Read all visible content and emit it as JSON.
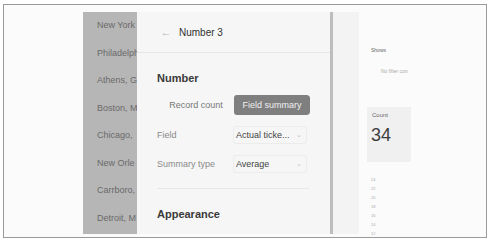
{
  "city_list": {
    "items": [
      "New York",
      "Philadelphia",
      "Athens, G",
      "Boston, M",
      "Chicago,",
      "New Orle",
      "Carrboro,",
      "Detroit, M"
    ]
  },
  "panel": {
    "title": "Number 3",
    "back_icon": "arrow-left-icon",
    "number_section": {
      "title": "Number",
      "toggle": {
        "options": [
          "Record count",
          "Field summary"
        ],
        "selected": "Field summary"
      },
      "field": {
        "label": "Field",
        "value": "Actual ticke..."
      },
      "summary_type": {
        "label": "Summary type",
        "value": "Average"
      }
    },
    "appearance_section": {
      "title": "Appearance"
    }
  },
  "preview": {
    "shows_label": "Shows",
    "filter_text": "No filter con",
    "count_card": {
      "label": "Count",
      "value": "34"
    },
    "axis_ticks": [
      "24",
      "22",
      "20",
      "18",
      "16",
      "14",
      "12"
    ]
  }
}
